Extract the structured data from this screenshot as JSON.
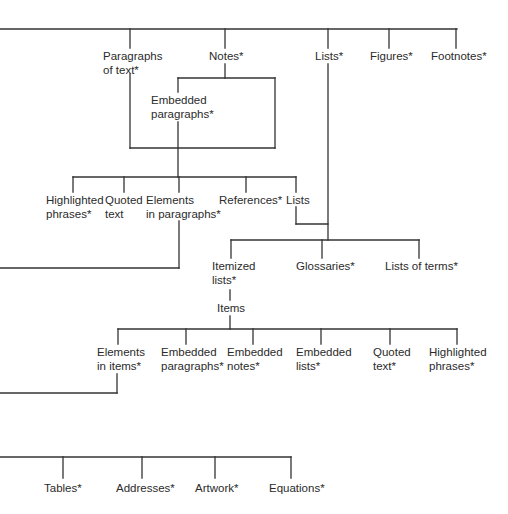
{
  "diagram": {
    "type": "tree",
    "line_color": "#333333",
    "background": "#ffffff",
    "top_level": {
      "paragraphs_of_text": [
        "Paragraphs",
        "of text*"
      ],
      "notes": [
        "Notes*"
      ],
      "lists": [
        "Lists*"
      ],
      "figures": [
        "Figures*"
      ],
      "footnotes": [
        "Footnotes*"
      ]
    },
    "notes_children": {
      "embedded_paragraphs": [
        "Embedded",
        "paragraphs*"
      ]
    },
    "paragraph_children": {
      "highlighted_phrases": [
        "Highlighted",
        "phrases*"
      ],
      "quoted_text": [
        "Quoted",
        "text"
      ],
      "elements_in_paragraphs": [
        "Elements",
        "in paragraphs*"
      ],
      "references": [
        "References*"
      ],
      "lists": [
        "Lists"
      ]
    },
    "list_types": {
      "itemized_lists": [
        "Itemized",
        "lists*"
      ],
      "glossaries": [
        "Glossaries*"
      ],
      "lists_of_terms": [
        "Lists of terms*"
      ]
    },
    "items": {
      "label": [
        "Items"
      ]
    },
    "item_children": {
      "elements_in_items": [
        "Elements",
        "in items*"
      ],
      "embedded_paragraphs": [
        "Embedded",
        "paragraphs*"
      ],
      "embedded_notes": [
        "Embedded",
        "notes*"
      ],
      "embedded_lists": [
        "Embedded",
        "lists*"
      ],
      "quoted_text": [
        "Quoted",
        "text*"
      ],
      "highlighted_phrases": [
        "Highlighted",
        "phrases*"
      ]
    },
    "element_types": {
      "tables": [
        "Tables*"
      ],
      "addresses": [
        "Addresses*"
      ],
      "artwork": [
        "Artwork*"
      ],
      "equations": [
        "Equations*"
      ]
    }
  }
}
